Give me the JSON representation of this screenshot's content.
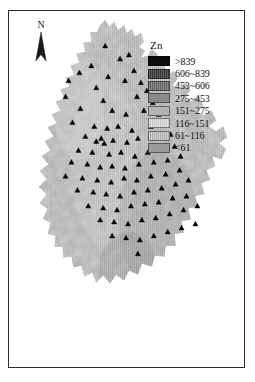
{
  "figure": {
    "kind": "thematic-map",
    "background_color": "#ffffff",
    "frame_color": "#2b2b2b"
  },
  "north_arrow": {
    "label": "N",
    "icon": "north-arrow-icon"
  },
  "legend": {
    "title": "Zn",
    "items": [
      {
        "label": ">839",
        "color": "#0d0d0d",
        "striped": false
      },
      {
        "label": "606~839",
        "color": "#3a3a3a",
        "striped": true
      },
      {
        "label": "453~606",
        "color": "#6e6e6e",
        "striped": true
      },
      {
        "label": "275~453",
        "color": "#8a8a8a",
        "striped": false
      },
      {
        "label": "151~275",
        "color": "#b4b4b4",
        "striped": false
      },
      {
        "label": "116~151",
        "color": "#dcdcdc",
        "striped": true
      },
      {
        "label": "61~116",
        "color": "#c2c2c2",
        "striped": true
      },
      {
        "label": "<61",
        "color": "#9b9b9b",
        "striped": false
      }
    ]
  },
  "map": {
    "raster_name": "zn-concentration-raster",
    "sample_points_name": "sampling-site-markers",
    "sample_point_color": "#000000",
    "sample_point_count": 96,
    "region_fill_base": "#a8a8a8",
    "region_outline": "#8f8f8f",
    "sample_points": [
      [
        97,
        35
      ],
      [
        83,
        55
      ],
      [
        112,
        48
      ],
      [
        121,
        44
      ],
      [
        71,
        62
      ],
      [
        100,
        66
      ],
      [
        60,
        70
      ],
      [
        117,
        70
      ],
      [
        88,
        77
      ],
      [
        126,
        60
      ],
      [
        133,
        72
      ],
      [
        57,
        86
      ],
      [
        95,
        90
      ],
      [
        129,
        86
      ],
      [
        139,
        80
      ],
      [
        145,
        92
      ],
      [
        72,
        98
      ],
      [
        104,
        100
      ],
      [
        118,
        104
      ],
      [
        136,
        100
      ],
      [
        151,
        104
      ],
      [
        64,
        112
      ],
      [
        86,
        116
      ],
      [
        99,
        118
      ],
      [
        110,
        116
      ],
      [
        124,
        120
      ],
      [
        143,
        116
      ],
      [
        158,
        112
      ],
      [
        77,
        126
      ],
      [
        93,
        128
      ],
      [
        88,
        131
      ],
      [
        96,
        133
      ],
      [
        105,
        130
      ],
      [
        119,
        132
      ],
      [
        130,
        128
      ],
      [
        148,
        126
      ],
      [
        163,
        124
      ],
      [
        70,
        140
      ],
      [
        84,
        142
      ],
      [
        101,
        144
      ],
      [
        113,
        142
      ],
      [
        127,
        146
      ],
      [
        140,
        142
      ],
      [
        155,
        140
      ],
      [
        167,
        136
      ],
      [
        63,
        152
      ],
      [
        79,
        154
      ],
      [
        92,
        157
      ],
      [
        104,
        156
      ],
      [
        117,
        158
      ],
      [
        131,
        154
      ],
      [
        146,
        152
      ],
      [
        160,
        150
      ],
      [
        173,
        146
      ],
      [
        57,
        166
      ],
      [
        74,
        168
      ],
      [
        89,
        170
      ],
      [
        103,
        172
      ],
      [
        116,
        168
      ],
      [
        129,
        170
      ],
      [
        143,
        166
      ],
      [
        158,
        164
      ],
      [
        172,
        160
      ],
      [
        69,
        180
      ],
      [
        85,
        182
      ],
      [
        98,
        184
      ],
      [
        112,
        186
      ],
      [
        126,
        182
      ],
      [
        140,
        180
      ],
      [
        154,
        178
      ],
      [
        168,
        174
      ],
      [
        181,
        170
      ],
      [
        80,
        196
      ],
      [
        95,
        198
      ],
      [
        109,
        200
      ],
      [
        123,
        196
      ],
      [
        137,
        194
      ],
      [
        151,
        192
      ],
      [
        165,
        188
      ],
      [
        179,
        186
      ],
      [
        92,
        210
      ],
      [
        106,
        212
      ],
      [
        120,
        214
      ],
      [
        134,
        210
      ],
      [
        148,
        208
      ],
      [
        162,
        204
      ],
      [
        176,
        200
      ],
      [
        190,
        196
      ],
      [
        104,
        226
      ],
      [
        118,
        228
      ],
      [
        132,
        230
      ],
      [
        146,
        226
      ],
      [
        160,
        222
      ],
      [
        174,
        218
      ],
      [
        188,
        214
      ],
      [
        130,
        244
      ]
    ]
  }
}
